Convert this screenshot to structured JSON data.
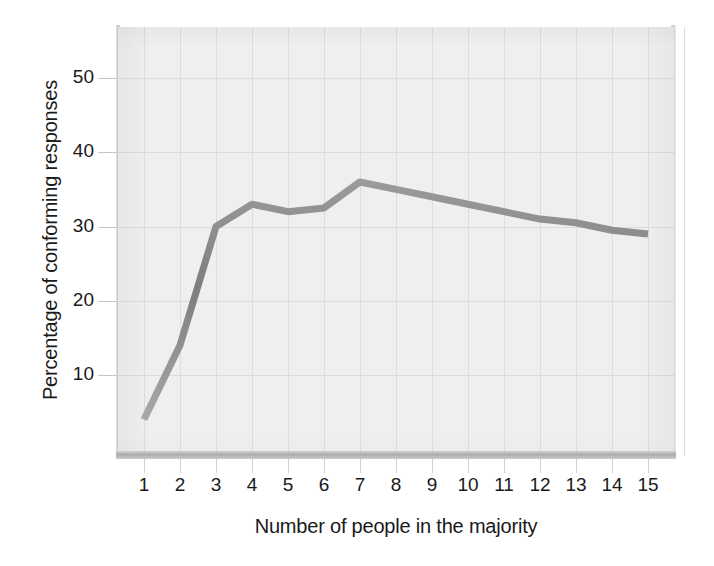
{
  "chart_data": {
    "type": "line",
    "title": "",
    "xlabel": "Number of people in the majority",
    "ylabel": "Percentage of conforming responses",
    "x": [
      1,
      2,
      3,
      4,
      5,
      6,
      7,
      8,
      9,
      10,
      11,
      12,
      13,
      14,
      15
    ],
    "categories": [
      "1",
      "2",
      "3",
      "4",
      "5",
      "6",
      "7",
      "8",
      "9",
      "10",
      "11",
      "12",
      "13",
      "14",
      "15"
    ],
    "values": [
      4,
      14,
      30,
      33,
      32,
      32.5,
      36,
      35,
      34,
      33,
      32,
      31,
      30.5,
      29.5,
      29
    ],
    "series": [
      {
        "name": "Percentage of conforming responses",
        "values": [
          4,
          14,
          30,
          33,
          32,
          32.5,
          36,
          35,
          34,
          33,
          32,
          31,
          30.5,
          29.5,
          29
        ]
      }
    ],
    "xticklabels": [
      "1",
      "2",
      "3",
      "4",
      "5",
      "6",
      "7",
      "8",
      "9",
      "10",
      "11",
      "12",
      "13",
      "14",
      "15"
    ],
    "yticks": [
      10,
      20,
      30,
      40,
      50
    ],
    "yticklabels": [
      "10",
      "20",
      "30",
      "40",
      "50"
    ],
    "xlim": [
      0.3,
      15.6
    ],
    "ylim": [
      0,
      56
    ],
    "grid": true,
    "legend": null,
    "line_color": "#8a8a8a",
    "plot_background": "#efefef",
    "gridline_color": "#dcdcdc",
    "text_color": "#1a1a1a"
  }
}
